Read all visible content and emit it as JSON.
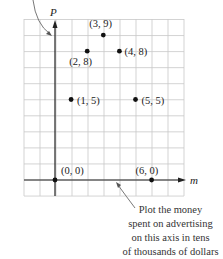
{
  "chart_data": {
    "type": "scatter",
    "title": "",
    "xlabel": "m",
    "ylabel": "P",
    "grid": true,
    "xlim": [
      -3,
      7
    ],
    "ylim": [
      -1,
      10
    ],
    "points": [
      {
        "x": 0,
        "y": 0,
        "label": "(0, 0)"
      },
      {
        "x": 1,
        "y": 5,
        "label": "(1, 5)"
      },
      {
        "x": 2,
        "y": 8,
        "label": "(2, 8)"
      },
      {
        "x": 3,
        "y": 9,
        "label": "(3, 9)"
      },
      {
        "x": 4,
        "y": 8,
        "label": "(4, 8)"
      },
      {
        "x": 5,
        "y": 5,
        "label": "(5, 5)"
      },
      {
        "x": 6,
        "y": 0,
        "label": "(6, 0)"
      }
    ]
  },
  "axes": {
    "x_label": "m",
    "y_label": "P"
  },
  "annotation": {
    "lines": [
      "Plot the money",
      "spent on advertising",
      "on this axis in tens",
      "of thousands of dollars"
    ]
  },
  "colors": {
    "grid": "#c8c8c8",
    "axis": "#222222",
    "point": "#111111"
  }
}
